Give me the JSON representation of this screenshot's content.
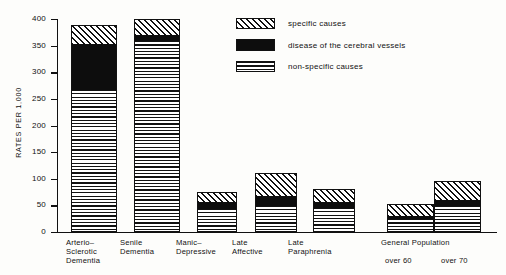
{
  "chart_data": {
    "type": "bar",
    "subtype": "stacked-bar",
    "title": "",
    "xlabel": "",
    "ylabel": "RATES PER 1,000",
    "ylim": [
      0,
      400
    ],
    "ytick_labels": [
      "400",
      "350",
      "300",
      "250",
      "200",
      "150",
      "100",
      "50",
      "0"
    ],
    "ytick_values": [
      400,
      350,
      300,
      250,
      200,
      150,
      100,
      50,
      0
    ],
    "grid": false,
    "legend_position": "top-right",
    "categories": [
      "Arterio-Sclerotic Dementia",
      "Senile Dementia",
      "Manic-Depressive",
      "Late Affective",
      "Late Paraphrenia",
      "General Population over 60",
      "General Population over 70"
    ],
    "series": [
      {
        "name": "non-specific causes",
        "pattern": "horizontal-lines",
        "values": [
          267,
          360,
          44,
          48,
          46,
          25,
          48
        ]
      },
      {
        "name": "disease of the cerebral vessels",
        "pattern": "solid-black",
        "values": [
          88,
          12,
          14,
          20,
          12,
          6,
          12
        ]
      },
      {
        "name": "specific causes",
        "pattern": "diagonal-hatch",
        "values": [
          33,
          28,
          17,
          42,
          22,
          21,
          35
        ]
      }
    ],
    "totals": [
      388,
      400,
      75,
      110,
      80,
      52,
      95
    ]
  },
  "axis": {
    "y_title": "RATES PER 1,000",
    "ticks": [
      "400",
      "350",
      "300",
      "250",
      "200",
      "150",
      "100",
      "50",
      "0"
    ]
  },
  "legend": {
    "items": [
      {
        "label": "specific causes",
        "pattern": "diagonal-hatch"
      },
      {
        "label": "disease of the cerebral vessels",
        "pattern": "solid-black"
      },
      {
        "label": "non-specific causes",
        "pattern": "horizontal-lines"
      }
    ]
  },
  "x_axis": {
    "labels": [
      {
        "lines": [
          "Arterio–",
          "Sclerotic",
          "Dementia"
        ]
      },
      {
        "lines": [
          "Senile",
          "Dementia"
        ]
      },
      {
        "lines": [
          "Manic–",
          "Depressive"
        ]
      },
      {
        "lines": [
          "Late",
          "Affective"
        ]
      },
      {
        "lines": [
          "Late",
          "Paraphrenia"
        ]
      }
    ],
    "group": {
      "title": "General Population",
      "sub_labels": [
        "over 60",
        "over 70"
      ]
    }
  }
}
